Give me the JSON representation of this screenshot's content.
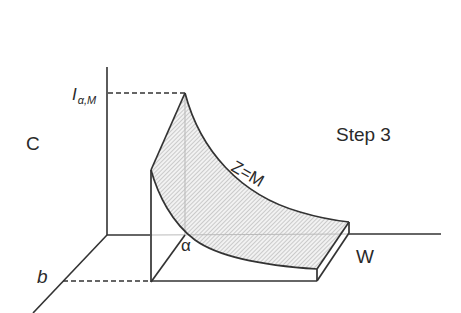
{
  "diagram": {
    "panel_label": "C",
    "step_label": "Step 3",
    "curve_label": "Z=M",
    "y_axis_value_main": "I",
    "y_axis_value_sub": "α,M",
    "x_axis_label": "W",
    "depth_axis_value": "b",
    "alpha_label": "α"
  },
  "colors": {
    "line": "#333333",
    "hatch": "#9a9a9a",
    "hatch_bg": "#f2f2f2",
    "guide": "#bbbbbb",
    "background": "#ffffff"
  }
}
